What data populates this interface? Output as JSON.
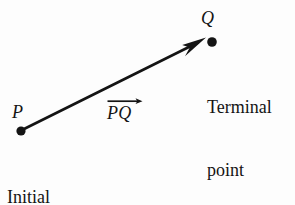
{
  "figure": {
    "type": "vector-diagram",
    "background_color": "#fdfdfd",
    "ink_color": "#141414"
  },
  "points": {
    "initial": {
      "letter": "P",
      "caption_line1": "Initial",
      "caption_line2": "point",
      "x": 21,
      "y": 131,
      "dot_radius": 4.6
    },
    "terminal": {
      "letter": "Q",
      "caption_line1": "Terminal",
      "caption_line2": "point",
      "x": 212,
      "y": 42,
      "dot_radius": 4.8
    }
  },
  "vector": {
    "label": "PQ",
    "overarrow_icon": "right-arrow-accent",
    "shaft": {
      "x1": 22,
      "y1": 130,
      "x2": 205,
      "y2": 39,
      "stroke_width": 2.6
    },
    "arrowhead": {
      "tip_x": 206,
      "tip_y": 38,
      "length": 26,
      "half_width": 7
    }
  }
}
